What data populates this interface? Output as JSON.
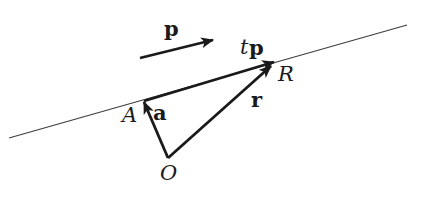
{
  "figure": {
    "description_colors": {
      "background": "#ffffff",
      "ink": "#1a1a1a",
      "thin_line": "#3d3d3d"
    },
    "labels": {
      "direction_vector_p": "p",
      "scalar_t": "t",
      "scaled_vector_p": "p",
      "point_R": "R",
      "point_A": "A",
      "position_vector_a": "a",
      "position_vector_r": "r",
      "origin_O": "O"
    }
  }
}
